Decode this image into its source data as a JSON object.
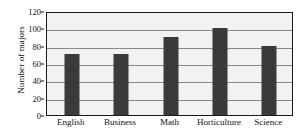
{
  "chart_data": {
    "type": "bar",
    "title": "",
    "subtitle": "",
    "xlabel": "",
    "ylabel": "Number of majors",
    "categories": [
      "English",
      "Business",
      "Math",
      "Horticulture",
      "Science"
    ],
    "values": [
      70,
      70,
      90,
      100,
      80
    ],
    "ylim": [
      0,
      120
    ],
    "yticks": [
      0,
      20,
      40,
      60,
      80,
      100,
      120
    ],
    "ytick_labels": [
      "0",
      "20",
      "40",
      "60",
      "80",
      "100",
      "120"
    ],
    "grid": true,
    "grid_axis": "y",
    "legend": false,
    "legend_position": "none",
    "annotations": []
  },
  "style": {
    "bar_color": "#3a3a3a",
    "plot_background": "#f2f2f0",
    "page_background": "#ffffff",
    "gridline_color": "#8a8a8a",
    "frame_color": "#1a1a1a",
    "text_color": "#111111"
  }
}
